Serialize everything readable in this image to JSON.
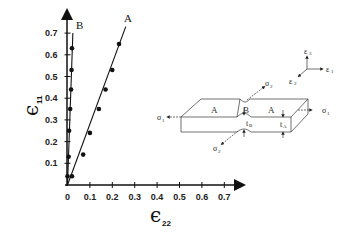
{
  "chart_data": {
    "type": "scatter",
    "title": "",
    "xlabel": "ε22",
    "ylabel": "ε11",
    "xlim": [
      0,
      0.75
    ],
    "ylim": [
      0,
      0.75
    ],
    "grid": false,
    "x_ticks": [
      "0",
      "0.1",
      "0.2",
      "0.3",
      "0.4",
      "0.5",
      "0.6",
      "0.7"
    ],
    "y_ticks": [
      "0.1",
      "0.2",
      "0.3",
      "0.4",
      "0.5",
      "0.6",
      "0.7"
    ],
    "series": [
      {
        "name": "A",
        "x": [
          0.02,
          0.07,
          0.1,
          0.14,
          0.17,
          0.2,
          0.23
        ],
        "y": [
          0.04,
          0.14,
          0.24,
          0.35,
          0.44,
          0.53,
          0.65
        ],
        "line_end": [
          0.26,
          0.73
        ]
      },
      {
        "name": "B",
        "x": [
          0.0,
          0.005,
          0.007,
          0.012,
          0.016,
          0.018,
          0.02
        ],
        "y": [
          0.04,
          0.13,
          0.25,
          0.35,
          0.44,
          0.53,
          0.63
        ],
        "line_end": [
          0.024,
          0.7
        ]
      }
    ],
    "annotations": [
      "A",
      "B"
    ]
  },
  "axes": {
    "x_symbol": "ϵ",
    "x_sub": "22",
    "y_symbol": "ϵ",
    "y_sub": "11"
  },
  "diagram": {
    "regions": [
      "A",
      "B",
      "A"
    ],
    "stress_left": "σ",
    "stress_left_sub": "1",
    "stress_right": "σ",
    "stress_right_sub": "1",
    "stress_top": "σ",
    "stress_top_sub": "2",
    "stress_bottom": "σ",
    "stress_bottom_sub": "2",
    "thickness_b": "t",
    "thickness_b_sub": "B",
    "thickness_a": "t",
    "thickness_a_sub": "A",
    "coord_1": "ε",
    "coord_1_sub": "1",
    "coord_2": "ε",
    "coord_2_sub": "2",
    "coord_3": "ε",
    "coord_3_sub": "3"
  }
}
